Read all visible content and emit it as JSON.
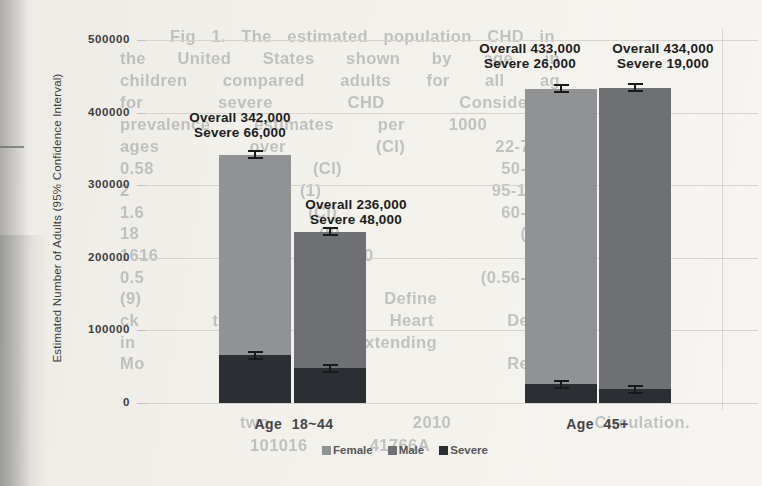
{
  "chart_data": {
    "type": "bar",
    "stacked": true,
    "title": "",
    "xlabel": "",
    "ylabel": "Estimated Number of Adults (95% Confidence Interval)",
    "ylim": [
      0,
      500000
    ],
    "yticks": [
      500000,
      400000,
      300000,
      200000,
      100000,
      0
    ],
    "ytick_labels": [
      "500000",
      "400000",
      "300000",
      "200000",
      "100000",
      "0"
    ],
    "grid": true,
    "error_bars": "95% CI whiskers at top of each overall bar and each severe segment",
    "legend": {
      "position": "bottom",
      "entries": [
        "Female",
        "Male",
        "Severe"
      ]
    },
    "groups": [
      {
        "label": "Age 18~44",
        "bars": [
          {
            "series": "Female",
            "overall": 342000,
            "severe": 66000,
            "annotation_line1": "Overall 342,000",
            "annotation_line2": "Severe 66,000"
          },
          {
            "series": "Male",
            "overall": 236000,
            "severe": 48000,
            "annotation_line1": "Overall 236,000",
            "annotation_line2": "Severe 48,000"
          }
        ]
      },
      {
        "label": "Age 45+",
        "bars": [
          {
            "series": "Female",
            "overall": 433000,
            "severe": 26000,
            "annotation_line1": "Overall 433,000",
            "annotation_line2": "Severe 26,000"
          },
          {
            "series": "Male",
            "overall": 434000,
            "severe": 19000,
            "annotation_line1": "Overall 434,000",
            "annotation_line2": "Severe 19,000"
          }
        ]
      }
    ]
  },
  "colors": {
    "female": "#919293",
    "male": "#6e7073",
    "severe": "#2b2f34",
    "gridline": "#d6d3cd",
    "annotation_text": "#1d1d1d",
    "axis_text": "#3d3d3d",
    "legend_text": "#565656",
    "paper": "#f2f0ea"
  },
  "background_bleed_text": {
    "lines": [
      {
        "y": 27,
        "left": 170,
        "width": 385,
        "text": "Fig 1. The estimated population  CHD in"
      },
      {
        "y": 49,
        "left": 120,
        "width": 440,
        "text": "the United States shown by age in"
      },
      {
        "y": 71,
        "left": 120,
        "width": 440,
        "text": "children compared adults for all ag"
      },
      {
        "y": 93,
        "left": 120,
        "width": 440,
        "text": "for severe CHD  Considering"
      },
      {
        "y": 115,
        "left": 120,
        "width": 440,
        "text": "prevalence estimates per 1000 (CI)"
      },
      {
        "y": 137,
        "left": 120,
        "width": 440,
        "text": "ages over  (CI) 22-7.92)"
      },
      {
        "y": 159,
        "left": 120,
        "width": 440,
        "text": "0.58  (CI) 50-0.94"
      },
      {
        "y": 181,
        "left": 120,
        "width": 440,
        "text": "2 (1)  95-13.95"
      },
      {
        "y": 203,
        "left": 120,
        "width": 440,
        "text": "1.6 (CI)  60-1.72"
      },
      {
        "y": 224,
        "left": 120,
        "width": 440,
        "text": "18 (8)  (0.22"
      },
      {
        "y": 246,
        "left": 120,
        "width": 440,
        "text": "1616 1640 2"
      },
      {
        "y": 268,
        "left": 120,
        "width": 440,
        "text": "0.5 (0.56-0.70"
      },
      {
        "y": 289,
        "left": 120,
        "width": 440,
        "text": "(9) (4)  Define  K"
      },
      {
        "y": 311,
        "left": 120,
        "width": 440,
        "text": "ck to  al Heart Defect"
      },
      {
        "y": 333,
        "left": 120,
        "width": 440,
        "text": "in the  extending the"
      },
      {
        "y": 354,
        "left": 120,
        "width": 440,
        "text": "Mo  the  Regist"
      },
      {
        "y": 413,
        "left": 240,
        "width": 450,
        "text": "two  2010  Circulation."
      },
      {
        "y": 436,
        "left": 250,
        "width": 180,
        "text": "101016 41766A"
      }
    ]
  }
}
